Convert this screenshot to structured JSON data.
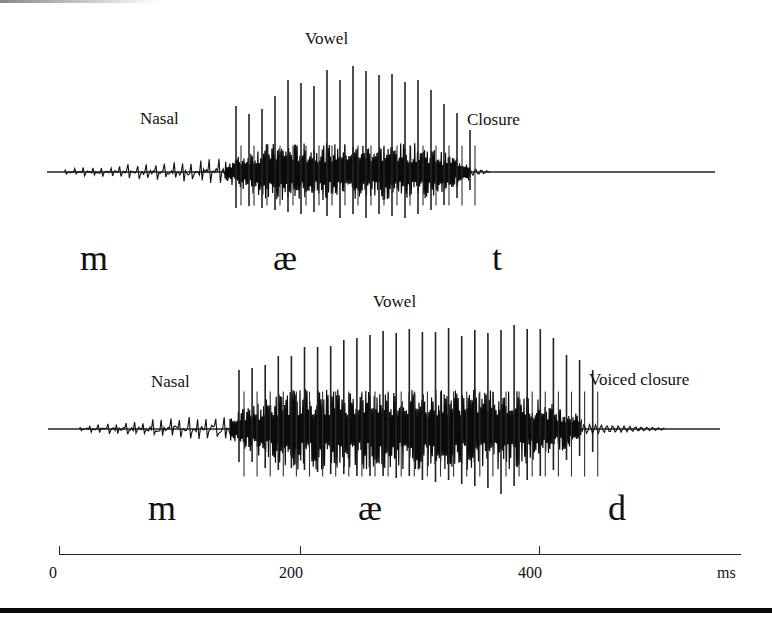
{
  "chart_data": {
    "type": "line",
    "title": "",
    "xlabel": "ms",
    "x_axis": {
      "ticks": [
        0,
        200,
        400
      ],
      "unit": "ms",
      "range": [
        0,
        570
      ]
    },
    "panels": [
      {
        "word": "mat",
        "segments": [
          {
            "label": "Nasal",
            "start_ms": 15,
            "end_ms": 140
          },
          {
            "label": "Vowel",
            "start_ms": 140,
            "end_ms": 350
          },
          {
            "label": "Closure",
            "start_ms": 350,
            "end_ms": 550
          }
        ],
        "phonemes": [
          "m",
          "æ",
          "t"
        ]
      },
      {
        "word": "mad",
        "segments": [
          {
            "label": "Nasal",
            "start_ms": 30,
            "end_ms": 150
          },
          {
            "label": "Vowel",
            "start_ms": 150,
            "end_ms": 435
          },
          {
            "label": "Voiced closure",
            "start_ms": 435,
            "end_ms": 550
          }
        ],
        "phonemes": [
          "m",
          "æ",
          "d"
        ]
      }
    ]
  },
  "top": {
    "labels": {
      "nasal": "Nasal",
      "vowel": "Vowel",
      "closure": "Closure"
    },
    "phonemes": {
      "p1": "m",
      "p2": "æ",
      "p3": "t"
    }
  },
  "bottom": {
    "labels": {
      "nasal": "Nasal",
      "vowel": "Vowel",
      "closure": "Voiced closure"
    },
    "phonemes": {
      "p1": "m",
      "p2": "æ",
      "p3": "d"
    }
  },
  "axis": {
    "ticks": [
      {
        "value": "0"
      },
      {
        "value": "200"
      },
      {
        "value": "400"
      }
    ],
    "unit": "ms"
  },
  "waves": [
    {
      "baseline_y": 172,
      "x_start": 47,
      "x_end": 715,
      "nasal": {
        "x0": 65,
        "x1": 225,
        "amp0": 3,
        "amp1": 14
      },
      "vowel": {
        "x0": 225,
        "x1": 470,
        "pulse_start": 236,
        "pulse_step": 13,
        "peak_up": [
          106,
          114,
          109,
          96,
          80,
          83,
          86,
          70,
          80,
          66,
          71,
          75,
          74,
          82,
          80,
          90,
          104,
          113,
          130
        ],
        "peak_down": [
          208,
          206,
          208,
          210,
          212,
          214,
          212,
          216,
          218,
          214,
          218,
          214,
          216,
          218,
          214,
          210,
          205,
          198,
          190
        ],
        "body": 24
      },
      "tail": {
        "x0": 470,
        "x1": 490,
        "amp": 4
      }
    },
    {
      "baseline_y": 429,
      "x_start": 48,
      "x_end": 720,
      "nasal": {
        "x0": 80,
        "x1": 232,
        "amp0": 3,
        "amp1": 16
      },
      "vowel": {
        "x0": 230,
        "x1": 582,
        "pulse_start": 239,
        "pulse_step": 13.1,
        "peak_up": [
          370,
          368,
          365,
          356,
          356,
          347,
          347,
          346,
          340,
          338,
          335,
          331,
          333,
          329,
          332,
          332,
          328,
          336,
          330,
          333,
          330,
          325,
          329,
          329,
          338,
          355,
          360,
          370
        ],
        "peak_down": [
          462,
          462,
          468,
          470,
          468,
          470,
          472,
          474,
          474,
          476,
          476,
          476,
          478,
          476,
          480,
          482,
          480,
          484,
          486,
          488,
          494,
          486,
          480,
          476,
          470,
          460,
          456,
          452
        ],
        "body": 34
      },
      "tail": {
        "x0": 582,
        "x1": 665,
        "amp": 5
      }
    }
  ]
}
